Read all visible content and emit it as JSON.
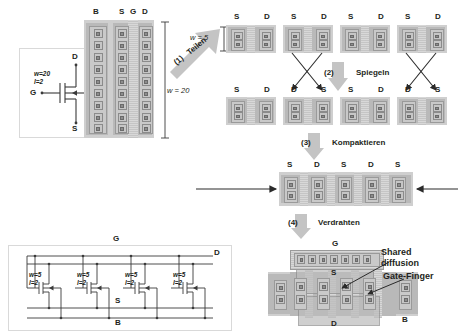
{
  "diagram": {
    "terminals": {
      "gate": "G",
      "drain": "D",
      "source": "S",
      "bulk": "B"
    }
  },
  "symbol_panel": {
    "name": "single-transistor-symbol",
    "width_label": "w=20",
    "length_label": "l=2",
    "terminal_d": "D",
    "terminal_g": "G",
    "terminal_b": "B",
    "terminal_s": "S"
  },
  "original_layout": {
    "name": "original-wide-transistor-layout",
    "columns": [
      "B",
      "S",
      "G",
      "D"
    ],
    "contacts_per_column": 9,
    "dim_w": "w = 20"
  },
  "step1": {
    "number": "(1)",
    "label": "Teilen",
    "result_dim": "w = 5"
  },
  "step2": {
    "number": "(2)",
    "label": "Spiegeln"
  },
  "step3": {
    "number": "(3)",
    "label": "Kompaktieren"
  },
  "step4": {
    "number": "(4)",
    "label": "Verdrahten"
  },
  "split_blocks": {
    "name": "split-and-mirrored-fingers",
    "rows": [
      {
        "row": "before-mirroring",
        "blocks": [
          {
            "left": "S",
            "right": "D",
            "mirrored": false
          },
          {
            "left": "S",
            "right": "D",
            "mirrored": false
          },
          {
            "left": "S",
            "right": "D",
            "mirrored": false
          },
          {
            "left": "S",
            "right": "D",
            "mirrored": false
          }
        ]
      },
      {
        "row": "after-mirroring",
        "blocks": [
          {
            "left": "S",
            "right": "D",
            "mirrored": false
          },
          {
            "left": "D",
            "right": "S",
            "mirrored": true
          },
          {
            "left": "S",
            "right": "D",
            "mirrored": false
          },
          {
            "left": "D",
            "right": "S",
            "mirrored": true
          }
        ]
      }
    ],
    "contacts_per_column": 2
  },
  "compacted": {
    "name": "compacted-finger-row",
    "columns": [
      "S",
      "D",
      "S",
      "D",
      "S"
    ],
    "contacts_per_column": 2
  },
  "final_layout": {
    "name": "final-wired-multifinger-layout",
    "gate_rail_label": "G",
    "source_label": "S",
    "drain_label": "D",
    "bulk_label": "B",
    "gate_contacts": 7,
    "annotations": [
      {
        "name": "shared-diffusion",
        "text_line1": "Shared",
        "text_line2": "diffusion"
      },
      {
        "name": "gate-finger",
        "text_line1": "Gate-Finger",
        "text_line2": ""
      }
    ]
  },
  "schematic_panel": {
    "name": "parallel-transistors-schematic",
    "rail_g": "G",
    "rail_d": "D",
    "rail_s": "S",
    "rail_b": "B",
    "transistors": [
      {
        "w": "w=5",
        "l": "l=2"
      },
      {
        "w": "w=5",
        "l": "l=2"
      },
      {
        "w": "w=5",
        "l": "l=2"
      },
      {
        "w": "w=5",
        "l": "l=2"
      }
    ]
  },
  "colors": {
    "diffusion": "#b9b9b9",
    "metal": "#c9c9c9",
    "poly": "#cdcdcd",
    "contact": "#8d8d8d",
    "step_arrow": "#c4c4c4",
    "panel_border": "#d9d9d9"
  }
}
